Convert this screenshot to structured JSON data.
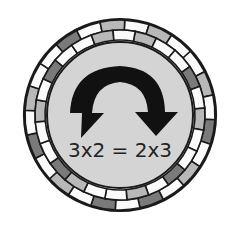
{
  "illustration": {
    "subject": "commutative-property-badge",
    "equation": "3x2 = 2x3",
    "icon": "curved-swap-arrow-icon",
    "colors": {
      "background": "#ffffff",
      "disc": "#d4d4d4",
      "outline": "#1a1a1a",
      "arrow": "#111111",
      "text": "#222222",
      "tile_light": "#fafafa",
      "tile_mid": "#b8b8b8",
      "tile_dark": "#7a7a7a"
    },
    "outer_ring_tiles": [
      "light",
      "mid",
      "light",
      "light",
      "mid",
      "light",
      "dark",
      "light",
      "mid",
      "light",
      "dark",
      "light",
      "dark",
      "light",
      "mid",
      "light",
      "dark",
      "light",
      "mid",
      "light",
      "light",
      "dark",
      "light",
      "mid"
    ],
    "inner_ring_tiles": [
      "mid",
      "light",
      "light",
      "dark",
      "light",
      "mid",
      "light",
      "light",
      "dark",
      "light",
      "mid",
      "light",
      "light",
      "mid",
      "dark",
      "light",
      "light",
      "mid",
      "light",
      "dark",
      "light",
      "light",
      "mid",
      "light"
    ]
  }
}
